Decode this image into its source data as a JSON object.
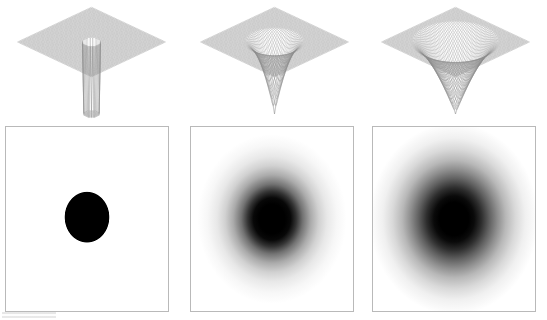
{
  "figure": {
    "kind": "scientific-figure-panel-grid",
    "rows": 2,
    "columns": 3,
    "background_color": "#ffffff",
    "ink_color": "#000000",
    "panel_border_color": "#b9b9b9"
  },
  "chart_data": [
    {
      "type": "surface",
      "panel_id": "surface-hard-well",
      "row": "top",
      "column": 1,
      "title": "",
      "xlabel": "",
      "ylabel": "",
      "zlabel": "",
      "description": "3D wireframe mesh of a flat plane containing a sharp-edged circular cylindrical well with vertical walls",
      "profile": "square-well",
      "well_radius": 0.16,
      "well_depth": 1.0,
      "edge_softness": 0.0,
      "plane_level": 0.0,
      "mesh_divisions": 64,
      "grid": true,
      "legend": "none",
      "view_elevation_deg": 28,
      "view_azimuth_deg": 45,
      "xlim": [
        -1,
        1
      ],
      "ylim": [
        -1,
        1
      ],
      "zlim": [
        -1,
        0.05
      ]
    },
    {
      "type": "surface",
      "panel_id": "surface-narrow-funnel",
      "row": "top",
      "column": 2,
      "title": "",
      "xlabel": "",
      "ylabel": "",
      "zlabel": "",
      "description": "3D wireframe mesh of a smooth narrow funnel well dipping from a flat plane",
      "profile": "smooth-funnel",
      "well_radius": 0.34,
      "well_depth": 1.0,
      "edge_softness": 0.45,
      "plane_level": 0.0,
      "mesh_divisions": 64,
      "grid": true,
      "legend": "none",
      "view_elevation_deg": 28,
      "view_azimuth_deg": 45,
      "xlim": [
        -1,
        1
      ],
      "ylim": [
        -1,
        1
      ],
      "zlim": [
        -1,
        0.05
      ]
    },
    {
      "type": "surface",
      "panel_id": "surface-wide-funnel",
      "row": "top",
      "column": 3,
      "title": "",
      "xlabel": "",
      "ylabel": "",
      "zlabel": "",
      "description": "3D wireframe mesh of a smooth wide conical funnel well dipping from a flat plane",
      "profile": "smooth-funnel",
      "well_radius": 0.46,
      "well_depth": 1.0,
      "edge_softness": 0.7,
      "plane_level": 0.0,
      "mesh_divisions": 64,
      "grid": true,
      "legend": "none",
      "view_elevation_deg": 28,
      "view_azimuth_deg": 45,
      "xlim": [
        -1,
        1
      ],
      "ylim": [
        -1,
        1
      ],
      "zlim": [
        -1,
        0.05
      ]
    },
    {
      "type": "heatmap",
      "panel_id": "density-hard-disk",
      "row": "bottom",
      "column": 1,
      "title": "",
      "xlabel": "",
      "ylabel": "",
      "description": "Top-down grayscale intensity map: uniformly black disk with a hard edge on a white field",
      "colormap": "gray-inverted",
      "value_min": 0.0,
      "value_max": 1.0,
      "center": [
        0.5,
        0.49
      ],
      "core_radius": 0.135,
      "halo_radius": 0.135,
      "edge_softness": 0.0,
      "radial_profile": [
        {
          "r": 0.0,
          "intensity": 1.0
        },
        {
          "r": 0.05,
          "intensity": 1.0
        },
        {
          "r": 0.1,
          "intensity": 1.0
        },
        {
          "r": 0.13,
          "intensity": 1.0
        },
        {
          "r": 0.135,
          "intensity": 1.0
        },
        {
          "r": 0.14,
          "intensity": 0.0
        },
        {
          "r": 0.2,
          "intensity": 0.0
        },
        {
          "r": 0.4,
          "intensity": 0.0
        }
      ],
      "grid": false,
      "legend": "none"
    },
    {
      "type": "heatmap",
      "panel_id": "density-narrow-blob",
      "row": "bottom",
      "column": 2,
      "title": "",
      "xlabel": "",
      "ylabel": "",
      "description": "Top-down grayscale intensity map: black core with a smooth gradual halo falling off to white",
      "colormap": "gray-inverted",
      "value_min": 0.0,
      "value_max": 1.0,
      "center": [
        0.5,
        0.5
      ],
      "core_radius": 0.115,
      "halo_radius": 0.42,
      "edge_softness": 0.55,
      "radial_profile": [
        {
          "r": 0.0,
          "intensity": 1.0
        },
        {
          "r": 0.08,
          "intensity": 1.0
        },
        {
          "r": 0.115,
          "intensity": 0.97
        },
        {
          "r": 0.15,
          "intensity": 0.8
        },
        {
          "r": 0.19,
          "intensity": 0.55
        },
        {
          "r": 0.24,
          "intensity": 0.33
        },
        {
          "r": 0.29,
          "intensity": 0.18
        },
        {
          "r": 0.34,
          "intensity": 0.09
        },
        {
          "r": 0.4,
          "intensity": 0.03
        },
        {
          "r": 0.46,
          "intensity": 0.0
        }
      ],
      "grid": false,
      "legend": "none"
    },
    {
      "type": "heatmap",
      "panel_id": "density-wide-blob",
      "row": "bottom",
      "column": 3,
      "title": "",
      "xlabel": "",
      "ylabel": "",
      "description": "Top-down grayscale intensity map: black core with a broader, softer halo falling off to white",
      "colormap": "gray-inverted",
      "value_min": 0.0,
      "value_max": 1.0,
      "center": [
        0.5,
        0.5
      ],
      "core_radius": 0.125,
      "halo_radius": 0.5,
      "edge_softness": 0.75,
      "radial_profile": [
        {
          "r": 0.0,
          "intensity": 1.0
        },
        {
          "r": 0.09,
          "intensity": 1.0
        },
        {
          "r": 0.125,
          "intensity": 0.96
        },
        {
          "r": 0.17,
          "intensity": 0.82
        },
        {
          "r": 0.22,
          "intensity": 0.62
        },
        {
          "r": 0.27,
          "intensity": 0.44
        },
        {
          "r": 0.32,
          "intensity": 0.28
        },
        {
          "r": 0.38,
          "intensity": 0.15
        },
        {
          "r": 0.44,
          "intensity": 0.06
        },
        {
          "r": 0.52,
          "intensity": 0.0
        }
      ],
      "grid": false,
      "legend": "none"
    }
  ]
}
